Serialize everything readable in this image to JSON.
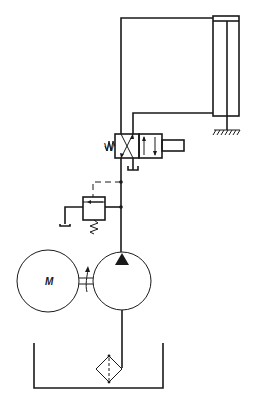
{
  "diagram": {
    "type": "hydraulic-circuit",
    "components": [
      {
        "id": "motor",
        "label": "M",
        "kind": "electric-motor"
      },
      {
        "id": "pump",
        "kind": "fixed-displacement-pump",
        "rotation": "unidirectional"
      },
      {
        "id": "tank",
        "kind": "reservoir"
      },
      {
        "id": "filter",
        "kind": "suction-filter"
      },
      {
        "id": "relief-valve",
        "kind": "pressure-relief-valve",
        "pilot": "dashed"
      },
      {
        "id": "directional-valve",
        "kind": "4/2-way-solenoid-valve",
        "spring_label": "W"
      },
      {
        "id": "cylinder",
        "kind": "double-acting-cylinder",
        "mount": "ground"
      }
    ],
    "labels": {
      "motor": "M",
      "spring": "W"
    },
    "colors": {
      "line": "#1a1a1a",
      "background": "#ffffff"
    }
  }
}
